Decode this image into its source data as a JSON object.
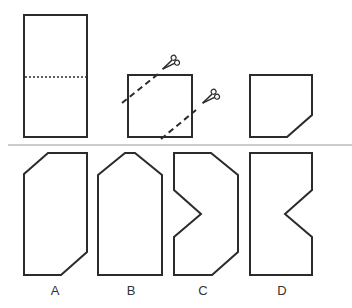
{
  "figure": {
    "type": "paper-folding-cutting-puzzle",
    "colors": {
      "stroke": "#2b2b2b",
      "divider": "#999999",
      "background": "#ffffff"
    },
    "top_row": {
      "step1": {
        "description": "rectangle with dotted horizontal fold line at middle"
      },
      "step2": {
        "description": "folded square with two dashed diagonal cut lines and two scissors",
        "icons": [
          "scissors-icon",
          "scissors-icon"
        ]
      },
      "step3": {
        "description": "resulting hexagon shape after cuts"
      }
    },
    "options": [
      {
        "label": "A"
      },
      {
        "label": "B"
      },
      {
        "label": "C"
      },
      {
        "label": "D"
      }
    ]
  }
}
